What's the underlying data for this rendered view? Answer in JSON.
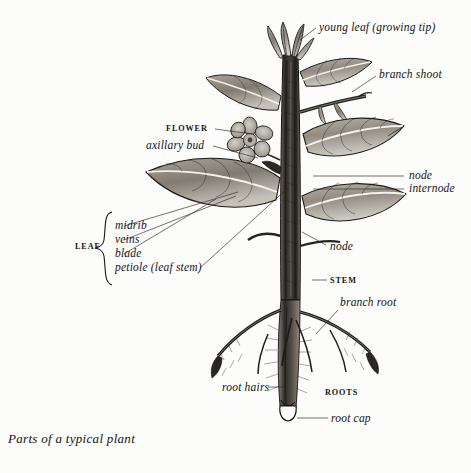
{
  "figure": {
    "title": "Parts of a typical plant",
    "background_color": "#fcfcfb",
    "ink_color": "#1a1a1a",
    "style": "engraved pen-and-ink botanical plate, grayscale"
  },
  "labels": {
    "young_leaf": "young leaf (growing tip)",
    "branch_shoot": "branch shoot",
    "flower": "FLOWER",
    "axillary_bud": "axillary bud",
    "node_upper": "node",
    "internode": "internode",
    "node_lower": "node",
    "stem": "STEM",
    "branch_root": "branch root",
    "roots": "ROOTS",
    "root_hairs": "root hairs",
    "root_cap": "root cap"
  },
  "leaf_group": {
    "bracket_label": "LEAF",
    "parts": [
      "midrib",
      "veins",
      "blade",
      "petiole (leaf stem)"
    ]
  },
  "caption": "Parts of a typical plant"
}
